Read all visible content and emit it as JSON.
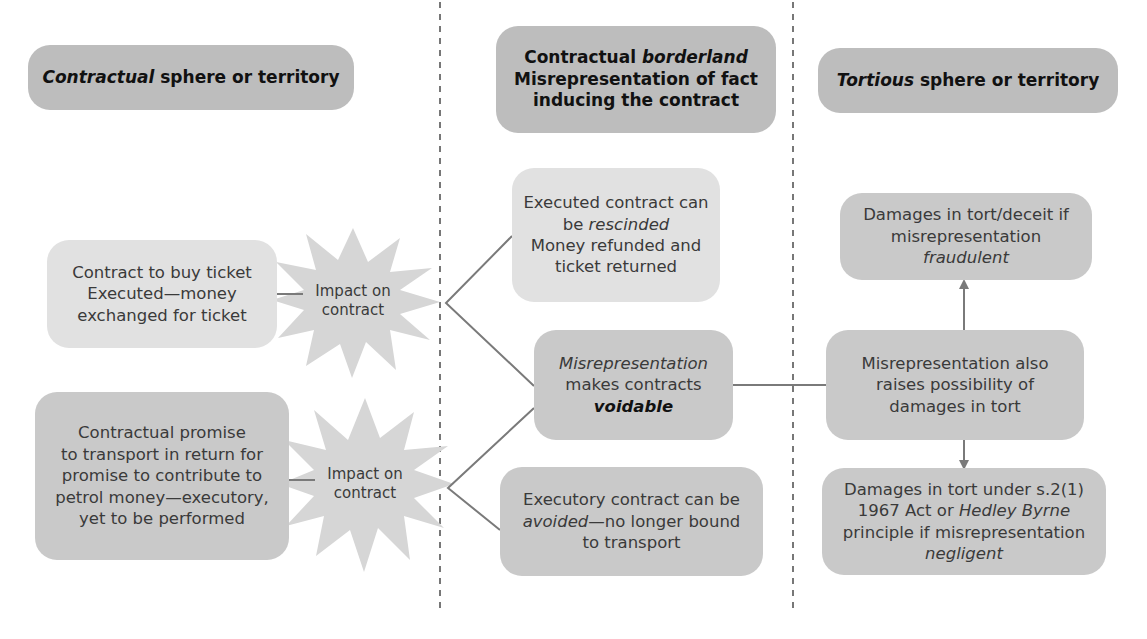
{
  "headers": {
    "contractual": {
      "italic": "Contractual",
      "rest": " sphere or territory"
    },
    "borderland": {
      "line1_plain": "Contractual ",
      "line1_italic": "borderland",
      "line2": "Misrepresentation of fact",
      "line3": "inducing the contract"
    },
    "tortious": {
      "italic": "Tortious",
      "rest": " sphere or territory"
    }
  },
  "contractual_sphere": {
    "executed_box": {
      "lines": [
        "Contract to buy ticket",
        "Executed—money",
        "exchanged for ticket"
      ]
    },
    "executory_box": {
      "lines": [
        "Contractual promise",
        "to transport in return for",
        "promise to contribute to",
        "petrol money—executory,",
        "yet to be performed"
      ]
    },
    "impact_1": {
      "lines": [
        "Impact on",
        "contract"
      ]
    },
    "impact_2": {
      "lines": [
        "Impact on",
        "contract"
      ]
    }
  },
  "borderland": {
    "rescinded_box": {
      "line1": "Executed contract can",
      "line2_plain": "be ",
      "line2_italic": "rescinded",
      "line3": "Money refunded and",
      "line4": "ticket returned"
    },
    "voidable_box": {
      "line1_italic": "Misrepresentation",
      "line2": "makes contracts",
      "line3_bold_italic": "voidable"
    },
    "avoided_box": {
      "line1": "Executory contract can be",
      "line2_italic": "avoided",
      "line2_plain": "—no longer bound",
      "line3": "to transport"
    }
  },
  "tortious_sphere": {
    "fraudulent_box": {
      "line1": "Damages in tort/deceit if",
      "line2_plain": "misrepresentation ",
      "line2_italic": "fraudulent"
    },
    "tort_box": {
      "lines": [
        "Misrepresentation also",
        "raises possibility of",
        "damages in tort"
      ]
    },
    "negligent_box": {
      "line1": "Damages in tort under s.2(1)",
      "line2_plain": "1967 Act or ",
      "line2_italic": "Hedley Byrne",
      "line3": "principle if misrepresentation",
      "line4_italic": "negligent"
    }
  },
  "colors": {
    "header_fill": "#bdbdbd",
    "dark_fill": "#c9c9c9",
    "light_fill": "#e1e1e1",
    "connector": "#7a7a7a",
    "divider": "#777777"
  }
}
